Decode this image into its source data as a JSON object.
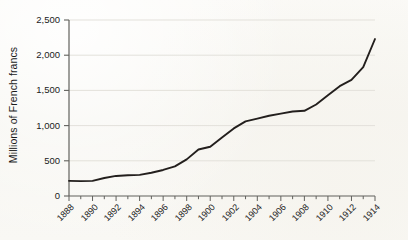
{
  "figure": {
    "background_color": "#f8f7f3",
    "line_color": "#231f1d",
    "grid_color": "#e2e0da",
    "axis_color": "#5a5a57",
    "text_color": "#1b1b1b"
  },
  "axes": {
    "ylabel": "Millions of French francs",
    "xlabel": "",
    "ytick_labels": [
      "2,500",
      "2,000",
      "1,500",
      "1,000",
      "500",
      "0"
    ],
    "xtick_labels": [
      "1888",
      "1890",
      "1892",
      "1894",
      "1896",
      "1898",
      "1900",
      "1902",
      "1904",
      "1906",
      "1908",
      "1910",
      "1912",
      "1914"
    ]
  },
  "chart_data": {
    "type": "line",
    "title": "",
    "xlabel": "",
    "ylabel": "Millions of French francs",
    "xlim": [
      1888,
      1914
    ],
    "ylim": [
      0,
      2500
    ],
    "ytick_values": [
      0,
      500,
      1000,
      1500,
      2000,
      2500
    ],
    "xtick_values": [
      1888,
      1890,
      1892,
      1894,
      1896,
      1898,
      1900,
      1902,
      1904,
      1906,
      1908,
      1910,
      1912,
      1914
    ],
    "minor_xticks_every": 1,
    "grid": "horizontal",
    "legend": "none",
    "series": [
      {
        "name": "Millions of French francs",
        "x": [
          1888,
          1889,
          1890,
          1891,
          1892,
          1893,
          1894,
          1895,
          1896,
          1897,
          1898,
          1899,
          1900,
          1901,
          1902,
          1903,
          1904,
          1905,
          1906,
          1907,
          1908,
          1909,
          1910,
          1911,
          1912,
          1913,
          1914
        ],
        "values": [
          215,
          212,
          215,
          255,
          285,
          295,
          300,
          330,
          370,
          420,
          520,
          660,
          700,
          830,
          960,
          1060,
          1100,
          1140,
          1170,
          1200,
          1210,
          1300,
          1430,
          1560,
          1650,
          1830,
          2230
        ]
      }
    ]
  }
}
